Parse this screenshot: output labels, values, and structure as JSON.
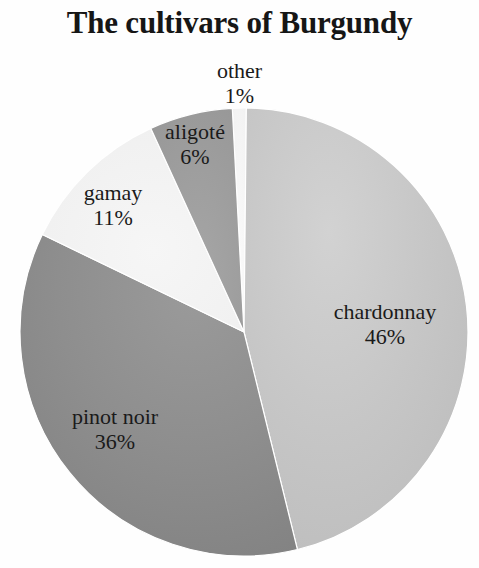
{
  "chart_data": {
    "type": "pie",
    "title": "The cultivars of Burgundy",
    "xlabel": "",
    "ylabel": "",
    "legend": "none",
    "grid": false,
    "value_suffix": "%",
    "start_angle_deg": -93,
    "direction": "clockwise",
    "categories": [
      "other",
      "chardonnay",
      "pinot noir",
      "gamay",
      "aligoté"
    ],
    "values": [
      1,
      46,
      36,
      11,
      6
    ],
    "slices": [
      {
        "name": "other",
        "value": 1,
        "value_label": "1%",
        "color": "#f7f7f7",
        "label_line1": "other",
        "label_line2": "1%"
      },
      {
        "name": "chardonnay",
        "value": 46,
        "value_label": "46%",
        "color": "#c6c6c6",
        "label_line1": "chardonnay",
        "label_line2": "46%"
      },
      {
        "name": "pinot noir",
        "value": 36,
        "value_label": "36%",
        "color": "#8e8e8e",
        "label_line1": "pinot noir",
        "label_line2": "36%"
      },
      {
        "name": "gamay",
        "value": 11,
        "value_label": "11%",
        "color": "#f2f2f2",
        "label_line1": "gamay",
        "label_line2": "11%"
      },
      {
        "name": "aligoté",
        "value": 6,
        "value_label": "6%",
        "color": "#9e9e9e",
        "label_line1": "aligoté",
        "label_line2": "6%"
      }
    ],
    "geometry": {
      "center_x": 244,
      "center_y": 332,
      "radius": 224
    },
    "background_color": "#fefefe",
    "text_color": "#1a1a1a"
  }
}
